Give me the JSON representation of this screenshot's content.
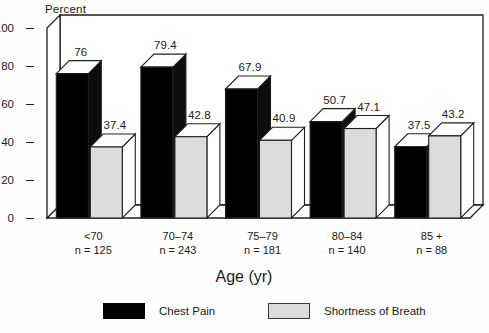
{
  "chart_data": {
    "type": "bar",
    "title": "",
    "ylabel": "Percent",
    "xlabel": "Age (yr)",
    "ylim": [
      0,
      100
    ],
    "yticks": [
      0,
      20,
      40,
      60,
      80,
      100
    ],
    "ytick_labels": [
      "0",
      "20",
      "40",
      "60",
      "80",
      "100"
    ],
    "grid": false,
    "legend_position": "bottom",
    "three_d": true,
    "categories": [
      "<70",
      "70–74",
      "75–79",
      "80–84",
      "85 +"
    ],
    "category_counts": [
      "n = 125",
      "n = 243",
      "n = 181",
      "n = 140",
      "n = 88"
    ],
    "series": [
      {
        "name": "Chest Pain",
        "color": "#000000",
        "values": [
          76,
          79.4,
          67.9,
          50.7,
          37.5
        ],
        "value_labels": [
          "76",
          "79.4",
          "67.9",
          "50.7",
          "37.5"
        ]
      },
      {
        "name": "Shortness of Breath",
        "color": "#dcdcdc",
        "values": [
          37.4,
          42.8,
          40.9,
          47.1,
          43.2
        ],
        "value_labels": [
          "37.4",
          "42.8",
          "40.9",
          "47.1",
          "43.2"
        ]
      }
    ]
  },
  "legend": {
    "items": [
      {
        "label": "Chest Pain",
        "swatch": "dark"
      },
      {
        "label": "Shortness of Breath",
        "swatch": "light"
      }
    ]
  },
  "colors": {
    "series_dark": "#000000",
    "series_light": "#dcdcdc",
    "axis": "#1f1f1f",
    "text": "#1a1a1a",
    "background": "#fefefe"
  }
}
